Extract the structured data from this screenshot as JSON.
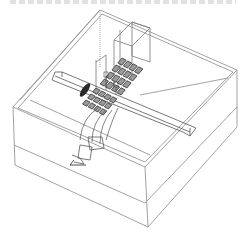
{
  "figure": {
    "type": "3D wireframe simulation model",
    "colors": {
      "background": "#ffffff",
      "line": "#8a8a8a",
      "dark_line": "#3a3a3a",
      "fill_dark": "#2a2a2a"
    },
    "components": [
      {
        "name": "outer-box",
        "description": "layered rectangular enclosure"
      },
      {
        "name": "straight-waveguide",
        "description": "long rectangular bar crossing diagonally"
      },
      {
        "name": "upper-tower",
        "description": "tall rectangular block at back"
      },
      {
        "name": "array-grid-upper",
        "description": "4x4 grid of cells on top"
      },
      {
        "name": "array-grid-lower",
        "description": "grid of cells at junction"
      },
      {
        "name": "bent-waveguide",
        "description": "curved waveguide going to front port"
      },
      {
        "name": "feed-port",
        "description": "port/feed at lower-left end"
      },
      {
        "name": "ellipse-disk",
        "description": "dark elliptical disk on bar"
      }
    ]
  }
}
